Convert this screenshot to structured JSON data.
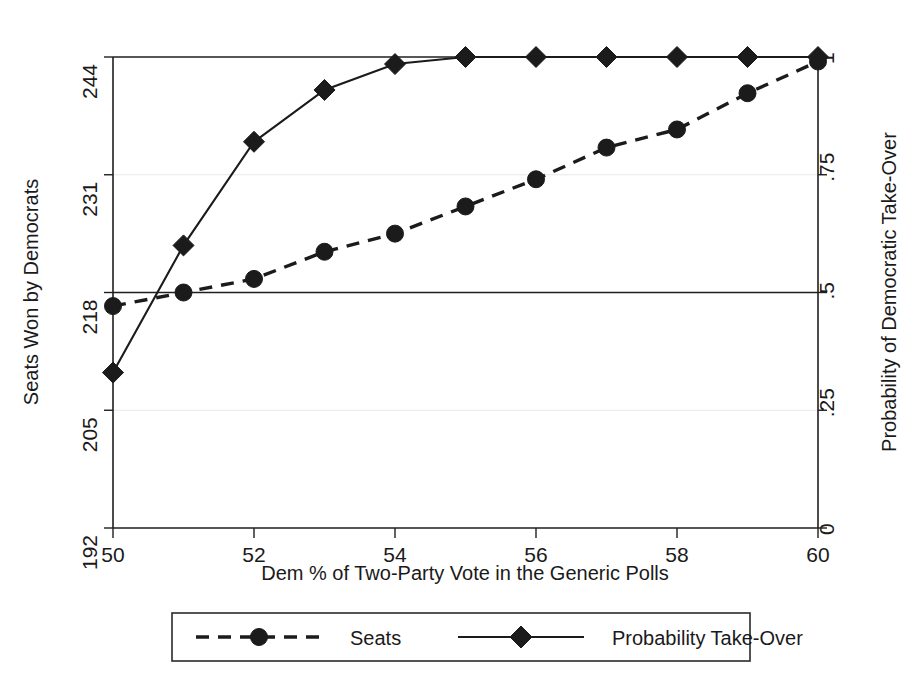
{
  "chart_data": {
    "type": "line",
    "title": "",
    "subtitle": "",
    "xlabel": "Dem % of Two-Party Vote in the Generic Polls",
    "ylabel": "Seats Won by Democrats",
    "y2label": "Probability of Democratic Take-Over",
    "x": [
      50,
      51,
      52,
      53,
      54,
      55,
      56,
      57,
      58,
      59,
      60
    ],
    "xlim": [
      50,
      60
    ],
    "xticks": [
      50,
      52,
      54,
      56,
      58,
      60
    ],
    "xtick_labels": [
      "50",
      "52",
      "54",
      "56",
      "58",
      "60"
    ],
    "ylim": [
      192,
      244
    ],
    "yticks": [
      192,
      205,
      218,
      231,
      244
    ],
    "ytick_labels": [
      "192",
      "205",
      "218",
      "231",
      "244"
    ],
    "y2lim": [
      0,
      1
    ],
    "y2ticks": [
      0,
      0.25,
      0.5,
      0.75,
      1
    ],
    "y2tick_labels": [
      "0",
      ".25",
      ".5",
      ".75",
      "1"
    ],
    "grid": true,
    "gridlines_emphasized": [
      218,
      244
    ],
    "legend_position": "below-center",
    "series": [
      {
        "name": "Seats",
        "axis": "left",
        "linestyle": "dashed",
        "marker": "circle",
        "color": "#1b1b1b",
        "values": [
          216.5,
          218.0,
          219.5,
          222.5,
          224.5,
          227.5,
          230.5,
          234.0,
          236.0,
          240.0,
          243.5
        ]
      },
      {
        "name": "Probability Take-Over",
        "axis": "right",
        "linestyle": "solid",
        "marker": "diamond",
        "color": "#1b1b1b",
        "values": [
          0.33,
          0.6,
          0.82,
          0.93,
          0.985,
          1.0,
          1.0,
          1.0,
          1.0,
          1.0,
          1.0
        ]
      }
    ],
    "legend": [
      {
        "label": "Seats",
        "marker": "circle",
        "linestyle": "dashed"
      },
      {
        "label": "Probability Take-Over",
        "marker": "diamond",
        "linestyle": "solid"
      }
    ]
  },
  "colors": {
    "ink": "#1b1b1b",
    "grid_light": "#e8e8e8",
    "grid_dark": "#1f1f1f",
    "background": "#ffffff"
  }
}
